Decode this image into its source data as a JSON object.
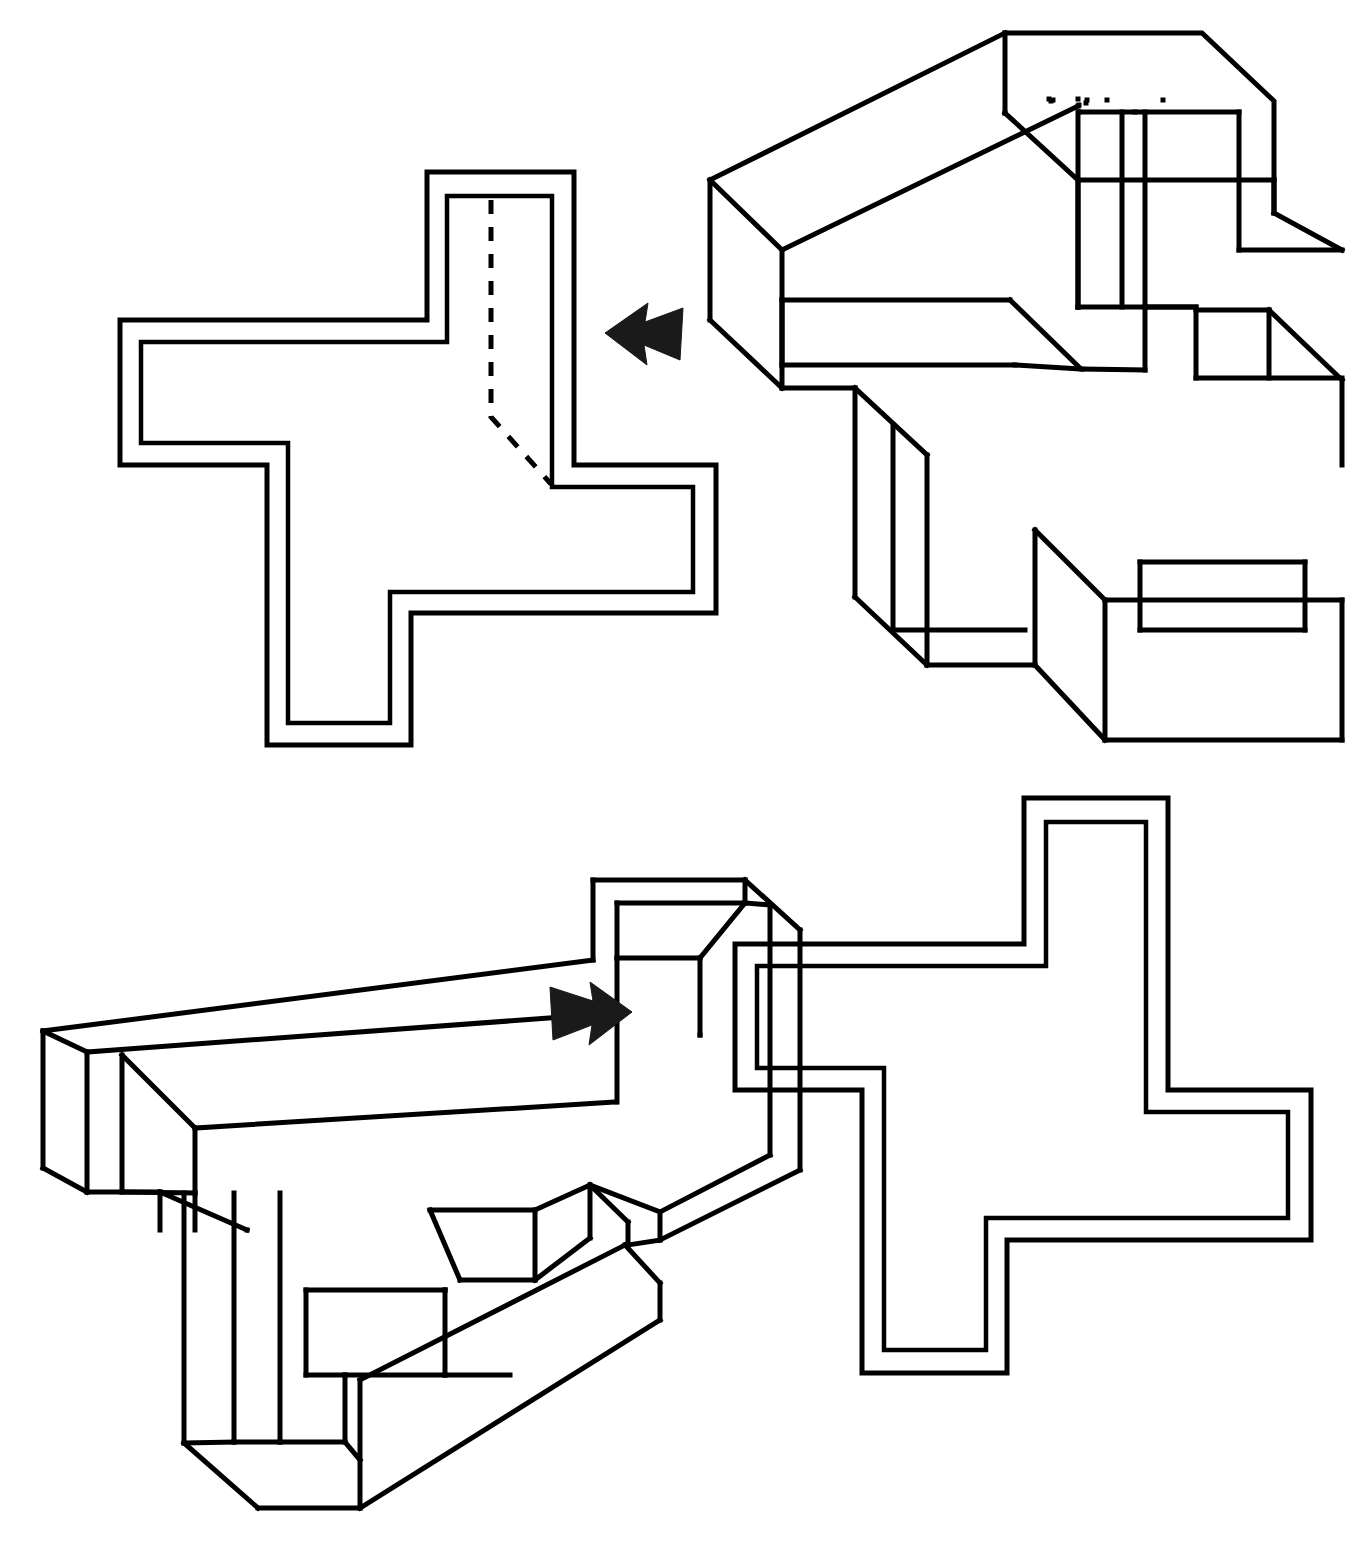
{
  "sheet": {
    "title": "Spatial rotation figure sheet",
    "background_color": "#ffffff",
    "ink_color": "#000000",
    "width": 1363,
    "height": 1555,
    "line_width": 5
  },
  "figures": [
    {
      "id": "top-left-flat",
      "name": "Flat plus-shaped outline with hidden fold line",
      "kind": "2d-outline",
      "row": "top",
      "column": "left",
      "has_dashed_hidden_line": true,
      "dashed_line_description": "vertical dashed line down the upper arm, bending diagonally to the inner notch corner",
      "outer_path": "M 427 172 L 574 172 L 574 465 L 716 465 L 716 613 L 411 613 L 411 745 L 267 745 L 267 465 L 120 465 L 120 320 L 427 320 Z",
      "inner_path": "M 447 196 L 552 196 L 552 487 L 693 487 L 693 592 L 390 592 L 390 723 L 288 723 L 288 443 L 141 443 L 141 342 L 447 342 Z",
      "dashed_path": "M 491 200 L 491 417 L 551 484"
    },
    {
      "id": "top-right-solid",
      "name": "Isometric plus-shaped slab, viewed from upper right",
      "kind": "3d-isometric",
      "row": "top",
      "column": "right",
      "has_dashed_hidden_line": false
    },
    {
      "id": "bottom-left-solid",
      "name": "Isometric plus-shaped slab, viewed from upper left",
      "kind": "3d-isometric",
      "row": "bottom",
      "column": "left",
      "has_dashed_hidden_line": false
    },
    {
      "id": "bottom-right-flat",
      "name": "Flat plus-shaped outline",
      "kind": "2d-outline",
      "row": "bottom",
      "column": "right",
      "has_dashed_hidden_line": false,
      "outer_path": "M 1024 798 L 1168 798 L 1168 1090 L 1311 1090 L 1311 1240 L 1007 1240 L 1007 1373 L 862 1373 L 862 1090 L 735 1090 L 735 944 L 1024 944 Z",
      "inner_path": "M 1046 822 L 1146 822 L 1146 1112 L 1288 1112 L 1288 1218 L 986 1218 L 986 1350 L 884 1350 L 884 1068 L 757 1068 L 757 966 L 1046 966 Z"
    }
  ],
  "arrows": [
    {
      "id": "arrow-left",
      "name": "left-pointing-arrow",
      "direction": "left",
      "between": [
        "top-right-solid",
        "top-left-flat"
      ],
      "x": 605,
      "y": 333,
      "color": "#1a1a1a"
    },
    {
      "id": "arrow-right",
      "name": "right-pointing-arrow",
      "direction": "right",
      "between": [
        "bottom-left-solid",
        "bottom-right-flat"
      ],
      "x": 545,
      "y": 1012,
      "color": "#1a1a1a"
    }
  ]
}
